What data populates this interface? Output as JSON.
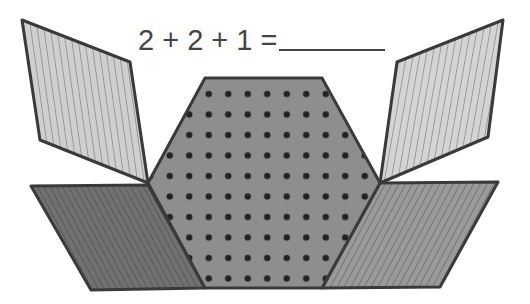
{
  "problem": {
    "equation": "2 + 2 + 1 =",
    "answer_blank": ""
  },
  "shapes": [
    {
      "name": "thin-rhombus-top-left",
      "fill": "#c8c8c8",
      "pattern": "vertical-lines",
      "count": 1
    },
    {
      "name": "thin-rhombus-top-right",
      "fill": "#d0d0d0",
      "pattern": "vertical-lines",
      "count": 1
    },
    {
      "name": "hexagon-center",
      "fill": "#8c8c8c",
      "pattern": "dots",
      "count": 2
    },
    {
      "name": "wide-rhombus-bottom-left",
      "fill": "#6e6e6e",
      "pattern": "diagonal-lines",
      "count": 1
    },
    {
      "name": "wide-rhombus-bottom-right",
      "fill": "#999999",
      "pattern": "diagonal-lines",
      "count": 1
    }
  ],
  "colors": {
    "stroke": "#3a3a3a",
    "text": "#444444",
    "dot": "#222222"
  }
}
